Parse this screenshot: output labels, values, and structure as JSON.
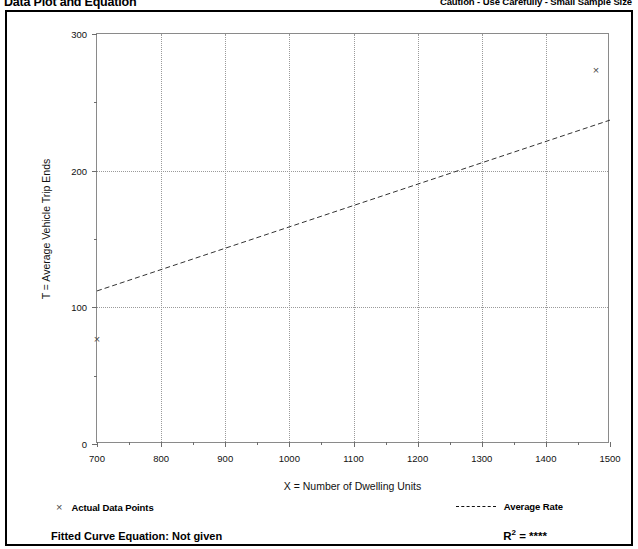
{
  "header": {
    "title": "Data Plot and Equation",
    "caution": "Caution - Use Carefully - Small Sample Size"
  },
  "legend": {
    "data_points_marker": "×",
    "data_points_label": "Actual Data Points",
    "average_rate_label": "Average Rate",
    "fitted_curve_label": "Fitted Curve Equation:  Not given",
    "r2_prefix": "R",
    "r2_sup": "2",
    "r2_value": "= ****"
  },
  "chart_data": {
    "type": "scatter",
    "title": "Data Plot and Equation",
    "xlabel": "X = Number of Dwelling Units",
    "ylabel": "T = Average Vehicle Trip Ends",
    "xlim": [
      700,
      1500
    ],
    "ylim": [
      0,
      300
    ],
    "xticks": [
      700,
      800,
      900,
      1000,
      1100,
      1200,
      1300,
      1400,
      1500
    ],
    "xtick_labels": [
      "700",
      "800",
      "900",
      "1000",
      "1100",
      "1200",
      "1300",
      "1400",
      "1500"
    ],
    "yticks": [
      0,
      100,
      200,
      300
    ],
    "ytick_labels": [
      "0",
      "100",
      "200",
      "300"
    ],
    "y_minor_ticks": [
      50,
      150,
      250
    ],
    "x_minor_ticks": [
      750,
      850,
      950,
      1050,
      1150,
      1250,
      1350,
      1450
    ],
    "grid": true,
    "grid_style": "dotted",
    "legend_position": "below-plot",
    "series": [
      {
        "name": "Actual Data Points",
        "type": "scatter",
        "marker": "x",
        "color": "#4a4a4a",
        "points": [
          {
            "x": 700,
            "y": 77
          },
          {
            "x": 1478,
            "y": 274
          }
        ]
      },
      {
        "name": "Average Rate",
        "type": "line",
        "style": "dashed",
        "color": "#333333",
        "x": [
          700,
          1500
        ],
        "y": [
          112,
          237
        ]
      }
    ]
  }
}
